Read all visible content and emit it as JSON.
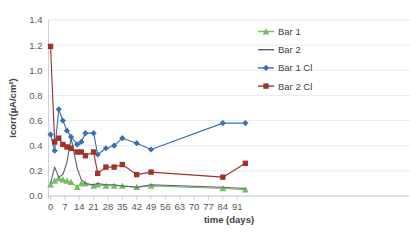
{
  "chart_data": {
    "type": "line",
    "title": "",
    "xlabel": "time (days)",
    "ylabel": "Icorr(µA/cm²)",
    "xlim": [
      -1,
      97
    ],
    "ylim": [
      0.0,
      1.4
    ],
    "ytick_step": 0.2,
    "grid": true,
    "legend_position": "right",
    "xticks": [
      0,
      7,
      14,
      21,
      28,
      35,
      42,
      49,
      56,
      63,
      70,
      77,
      84,
      91
    ],
    "xtick_labels": [
      "0",
      "7",
      "14",
      "21",
      "28",
      "35",
      "42",
      "49",
      "56",
      "63",
      "70",
      "77",
      "84",
      "91"
    ],
    "yticks": [
      0.0,
      0.2,
      0.4,
      0.6,
      0.8,
      1.0,
      1.2,
      1.4
    ],
    "ytick_labels": [
      "0.0",
      "0.2",
      "0.4",
      "0.6",
      "0.8",
      "1.0",
      "1.2",
      "1.4"
    ],
    "series": [
      {
        "name": "Bar 1",
        "color": "#77bc65",
        "marker": "triangle",
        "line_color": "#77bc65",
        "x": [
          0,
          2,
          4,
          6,
          8,
          10,
          13,
          15,
          17,
          21,
          23,
          27,
          31,
          35,
          42,
          49,
          84,
          95
        ],
        "values": [
          0.09,
          0.12,
          0.14,
          0.13,
          0.12,
          0.11,
          0.07,
          0.1,
          0.1,
          0.08,
          0.09,
          0.08,
          0.08,
          0.08,
          0.07,
          0.08,
          0.06,
          0.05
        ]
      },
      {
        "name": "Bar 2",
        "color": "#5c5878",
        "marker": "none",
        "line_color": "#5c5878",
        "x": [
          0,
          2,
          4,
          6,
          8,
          10,
          13,
          15,
          17,
          21,
          23,
          27,
          31,
          35,
          42,
          49,
          84,
          95
        ],
        "values": [
          0.1,
          0.23,
          0.15,
          0.17,
          0.27,
          0.46,
          0.22,
          0.13,
          0.1,
          0.09,
          0.1,
          0.09,
          0.09,
          0.08,
          0.07,
          0.09,
          0.07,
          0.06
        ]
      },
      {
        "name": "Bar 1 Cl",
        "color": "#3c6fae",
        "marker": "diamond",
        "line_color": "#3c6fae",
        "x": [
          0,
          2,
          4,
          6,
          8,
          10,
          13,
          15,
          17,
          21,
          23,
          27,
          31,
          35,
          42,
          49,
          84,
          95
        ],
        "values": [
          0.49,
          0.36,
          0.69,
          0.6,
          0.52,
          0.47,
          0.41,
          0.43,
          0.5,
          0.5,
          0.33,
          0.38,
          0.4,
          0.46,
          0.42,
          0.37,
          0.58,
          0.58
        ]
      },
      {
        "name": "Bar 2 Cl",
        "color": "#9c332c",
        "marker": "square",
        "line_color": "#9c332c",
        "x": [
          0,
          2,
          4,
          6,
          8,
          10,
          13,
          15,
          17,
          21,
          23,
          27,
          31,
          35,
          42,
          49,
          84,
          95
        ],
        "values": [
          1.19,
          0.43,
          0.46,
          0.41,
          0.39,
          0.38,
          0.35,
          0.35,
          0.32,
          0.35,
          0.18,
          0.23,
          0.23,
          0.25,
          0.17,
          0.19,
          0.15,
          0.26
        ]
      }
    ]
  },
  "legend": {
    "items": [
      {
        "label": "Bar 1"
      },
      {
        "label": "Bar 2"
      },
      {
        "label": "Bar 1 Cl"
      },
      {
        "label": "Bar 2 Cl"
      }
    ]
  },
  "colors": {
    "bar1": "#77bc65",
    "bar2": "#5c5878",
    "bar1cl": "#3c6fae",
    "bar2cl": "#9c332c",
    "grid": "#d9e2f0",
    "axis": "#b8c6dd",
    "tick_text": "#595959",
    "title_text": "#404040",
    "background": "#ffffff"
  }
}
